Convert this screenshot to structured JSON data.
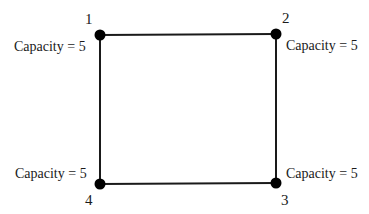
{
  "diagram": {
    "type": "graph",
    "nodes": [
      {
        "id": "1",
        "label": "1",
        "capacity_label": "Capacity = 5",
        "x": 100,
        "y": 35
      },
      {
        "id": "2",
        "label": "2",
        "capacity_label": "Capacity = 5",
        "x": 276,
        "y": 34
      },
      {
        "id": "3",
        "label": "3",
        "capacity_label": "Capacity = 5",
        "x": 276,
        "y": 183
      },
      {
        "id": "4",
        "label": "4",
        "capacity_label": "Capacity = 5",
        "x": 100,
        "y": 184
      }
    ],
    "edges": [
      {
        "from": "1",
        "to": "2"
      },
      {
        "from": "2",
        "to": "3"
      },
      {
        "from": "3",
        "to": "4"
      },
      {
        "from": "4",
        "to": "1"
      }
    ],
    "colors": {
      "node": "#000000",
      "edge": "#1a1a1a",
      "text": "#1a1a1a",
      "background": "#ffffff"
    }
  }
}
